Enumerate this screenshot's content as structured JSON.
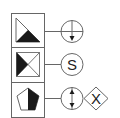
{
  "diagram": {
    "type": "symbol-legend",
    "colors": {
      "stroke": "#555555",
      "fill": "#1a1a1a",
      "background": "#ffffff"
    },
    "rows": [
      {
        "left_symbol": "triangle-half-filled-icon",
        "right_symbols": [
          "circle-crosshair-down-arrow-icon"
        ]
      },
      {
        "left_symbol": "square-x-left-filled-icon",
        "right_symbols": [
          "circle-s-icon"
        ],
        "right_label": "S"
      },
      {
        "left_symbol": "pentagon-right-half-filled-icon",
        "right_symbols": [
          "circle-double-arrow-icon",
          "diamond-x-icon"
        ],
        "diamond_label": "X"
      }
    ]
  }
}
